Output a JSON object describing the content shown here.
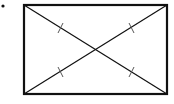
{
  "diagram": {
    "bullet": {
      "cx": 3,
      "cy": 6,
      "r": 1.6
    },
    "rectangle": {
      "x": 24,
      "y": 5,
      "width": 143,
      "height": 89,
      "stroke": "#111111",
      "stroke_width": 2.2
    },
    "diagonals": [
      {
        "x1": 24,
        "y1": 5,
        "x2": 167,
        "y2": 94
      },
      {
        "x1": 24,
        "y1": 94,
        "x2": 167,
        "y2": 5
      }
    ],
    "tick_marks": [
      {
        "cx": 60,
        "cy": 28
      },
      {
        "cx": 131,
        "cy": 28
      },
      {
        "cx": 60,
        "cy": 72
      },
      {
        "cx": 131,
        "cy": 72
      }
    ],
    "line_color": "#111111",
    "tick_color": "#555555"
  }
}
